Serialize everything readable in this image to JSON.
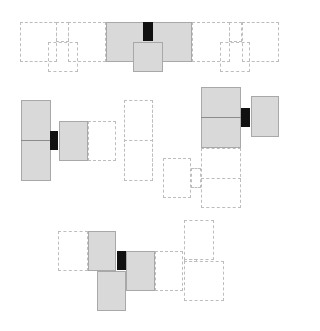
{
  "diagram": {
    "title": "",
    "colors": {
      "filled": "#d9d9d9",
      "filled_border": "#a8a8a8",
      "dashed_border": "#bdbdbd",
      "connector": "#111111"
    },
    "groups": [
      {
        "name": "top",
        "filled": 2,
        "dashed": 4,
        "connectors": 1
      },
      {
        "name": "middle-left",
        "filled": 2,
        "dashed": 2,
        "connectors": 1
      },
      {
        "name": "middle-right",
        "filled": 2,
        "dashed": 2,
        "connectors": 1
      },
      {
        "name": "bottom",
        "filled": 3,
        "dashed": 4,
        "connectors": 1
      }
    ]
  }
}
